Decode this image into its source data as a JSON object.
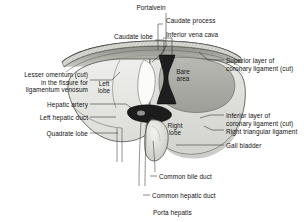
{
  "figure": {
    "background_color": "#ffffff",
    "ink_color": "#111111"
  },
  "internal_labels": [
    {
      "name": "left-lobe",
      "text": "Left\nlobe",
      "x": 104,
      "y": 80
    },
    {
      "name": "bare-area",
      "text": "Bare\narea",
      "x": 183,
      "y": 68
    },
    {
      "name": "right-lobe",
      "text": "Right\nlobe",
      "x": 175,
      "y": 122
    }
  ],
  "callouts": [
    {
      "name": "portal-vein",
      "text": "Portalvein",
      "x": 151,
      "y": 4,
      "align": "center"
    },
    {
      "name": "caudate-process",
      "text": "Caudate process",
      "x": 166,
      "y": 17,
      "align": "left"
    },
    {
      "name": "inferior-vena-cava",
      "text": "Inferior vena cava",
      "x": 166,
      "y": 31,
      "align": "left"
    },
    {
      "name": "caudate-lobe",
      "text": "Caudate lobe",
      "x": 153,
      "y": 33,
      "align": "right"
    },
    {
      "name": "superior-layer-coronary",
      "text": "Superior layer of\ncoronary ligament (cut)",
      "x": 226,
      "y": 57,
      "align": "left"
    },
    {
      "name": "lesser-omentum",
      "text": "Lesser omentum (cut)\nin the fissure for\nligamentum venosum",
      "x": 88,
      "y": 71,
      "align": "right"
    },
    {
      "name": "inferior-layer-coronary",
      "text": "Inferior layer of\ncoronary ligament (cut)",
      "x": 226,
      "y": 112,
      "align": "left"
    },
    {
      "name": "right-triangular-ligament",
      "text": "Right triangular ligament",
      "x": 226,
      "y": 128,
      "align": "left"
    },
    {
      "name": "hepatic-artery",
      "text": "Hepatic artery",
      "x": 88,
      "y": 101,
      "align": "right"
    },
    {
      "name": "left-hepatic-duct",
      "text": "Left hepatic duct",
      "x": 88,
      "y": 114,
      "align": "right"
    },
    {
      "name": "quadrate-lobe",
      "text": "Quadrate lobe",
      "x": 88,
      "y": 130,
      "align": "right"
    },
    {
      "name": "gall-bladder",
      "text": "Gall bladder",
      "x": 226,
      "y": 142,
      "align": "left"
    },
    {
      "name": "common-bile-duct",
      "text": "Common bile duct",
      "x": 159,
      "y": 173,
      "align": "left"
    },
    {
      "name": "common-hepatic-duct",
      "text": "Common hepatic duct",
      "x": 152,
      "y": 192,
      "align": "left"
    },
    {
      "name": "porta-hepatis",
      "text": "Porta hepatis",
      "x": 153,
      "y": 209,
      "align": "left"
    }
  ]
}
